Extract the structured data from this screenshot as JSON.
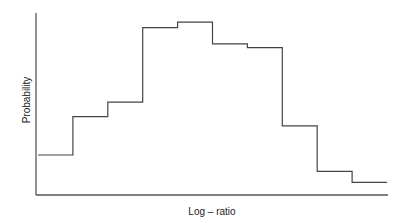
{
  "chart_data": {
    "type": "bar",
    "style": "step-histogram",
    "title": "",
    "xlabel": "Log – ratio",
    "ylabel": "Probability",
    "categories": [
      "bin1",
      "bin2",
      "bin3",
      "bin4",
      "bin5",
      "bin6",
      "bin7",
      "bin8",
      "bin9",
      "bin10"
    ],
    "values": [
      0.22,
      0.43,
      0.51,
      0.92,
      0.95,
      0.83,
      0.81,
      0.38,
      0.13,
      0.07
    ],
    "ylim": [
      0,
      1
    ],
    "grid": false,
    "legend": "none",
    "ticks_shown": false
  }
}
